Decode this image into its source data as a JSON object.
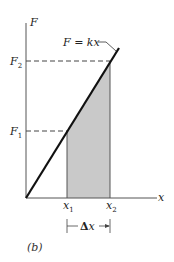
{
  "figure": {
    "caption": "(b)",
    "equation_label": "F = kx",
    "axes": {
      "y_label": "F",
      "x_label": "x"
    },
    "ticks": {
      "F1": {
        "main": "F",
        "sub": "1"
      },
      "F2": {
        "main": "F",
        "sub": "2"
      },
      "x1": {
        "main": "x",
        "sub": "1"
      },
      "x2": {
        "main": "x",
        "sub": "2"
      }
    },
    "interval_label": {
      "delta": "Δ",
      "var": "x"
    },
    "colors": {
      "line": "#111111",
      "axis": "#555555",
      "shade": "#c9c9c9",
      "dash": "#444444"
    }
  }
}
